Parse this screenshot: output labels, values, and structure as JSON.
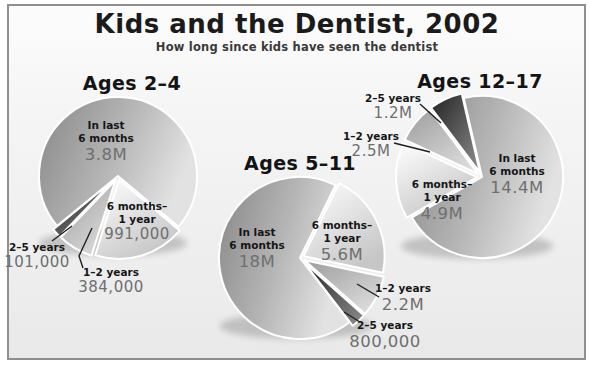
{
  "chart_data": {
    "type": "pie",
    "title": "Kids and the Dentist, 2002",
    "subtitle": "How long since kids have seen the dentist",
    "layout_hint": "three exploded grayscale 3D-style pie charts with leader lines; values labeled inside large slices and outside small slices",
    "legend": "none",
    "colors": {
      "recent_slice_dark": "#878787",
      "recent_slice_light": "#e2e2e2",
      "half_year_slice_light": "#ffffff",
      "half_year_slice_dark": "#c6c6c6",
      "one_two_year_slice": "#b4b4b4",
      "two_five_year_slice": "#262626",
      "background": "#f2f2f2",
      "frame_border": "#8f8f8f",
      "label_text": "#161616",
      "value_text": "#6f6f6f"
    },
    "pies": [
      {
        "group": "Ages 2–4",
        "slices": [
          {
            "label": "In last 6 months",
            "label_lines": [
              "In last",
              "6 months"
            ],
            "value": 3800000,
            "display": "3.8M"
          },
          {
            "label": "6 months–1 year",
            "label_lines": [
              "6 months–",
              "1 year"
            ],
            "value": 991000,
            "display": "991,000"
          },
          {
            "label": "1–2 years",
            "value": 384000,
            "display": "384,000"
          },
          {
            "label": "2–5 years",
            "value": 101000,
            "display": "101,000"
          }
        ]
      },
      {
        "group": "Ages 5–11",
        "slices": [
          {
            "label": "In last 6 months",
            "label_lines": [
              "In last",
              "6 months"
            ],
            "value": 18000000,
            "display": "18M"
          },
          {
            "label": "6 months–1 year",
            "label_lines": [
              "6 months–",
              "1 year"
            ],
            "value": 5600000,
            "display": "5.6M"
          },
          {
            "label": "1–2 years",
            "value": 2200000,
            "display": "2.2M"
          },
          {
            "label": "2–5 years",
            "value": 800000,
            "display": "800,000"
          }
        ]
      },
      {
        "group": "Ages 12–17",
        "slices": [
          {
            "label": "In last 6 months",
            "label_lines": [
              "In last",
              "6 months"
            ],
            "value": 14400000,
            "display": "14.4M"
          },
          {
            "label": "6 months–1 year",
            "label_lines": [
              "6 months–",
              "1 year"
            ],
            "value": 4900000,
            "display": "4.9M"
          },
          {
            "label": "1–2 years",
            "value": 2500000,
            "display": "2.5M"
          },
          {
            "label": "2–5 years",
            "value": 1200000,
            "display": "1.2M"
          }
        ]
      }
    ]
  }
}
